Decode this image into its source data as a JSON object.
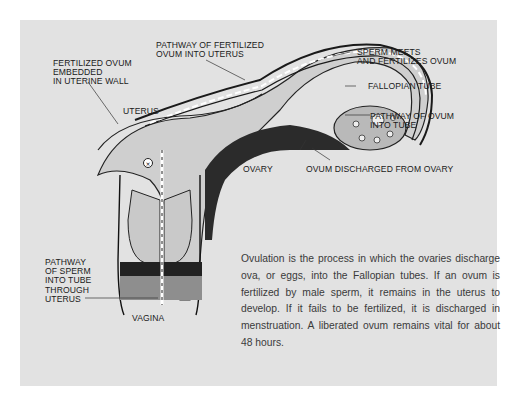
{
  "diagram": {
    "background_color": "#e2e2e2",
    "labels": {
      "fertilized_ovum_embedded": "FERTILIZED OVUM\nEMBEDDED\nIN UTERINE WALL",
      "pathway_fertilized_ovum": "PATHWAY OF FERTILIZED\nOVUM INTO UTERUS",
      "sperm_meets": "SPERM MEETS\nAND FERTILIZES OVUM",
      "fallopian_tube": "FALLOPIAN TUBE",
      "pathway_ovum_tube": "PATHWAY OF OVUM\nINTO TUBE",
      "uterus": "UTERUS",
      "ovary": "OVARY",
      "ovum_discharged": "OVUM DISCHARGED FROM OVARY",
      "pathway_sperm": "PATHWAY\nOF SPERM\nINTO TUBE\nTHROUGH\nUTERUS",
      "vagina": "VAGINA"
    },
    "caption": "Ovulation is the process in which the ovaries discharge ova, or eggs, into the Fallopian tubes. If an ovum is fertilized by male sperm, it remains in the uterus to develop. If it fails to be fertilized, it is discharged in menstruation. A liberated ovum remains vital for about 48 hours."
  }
}
